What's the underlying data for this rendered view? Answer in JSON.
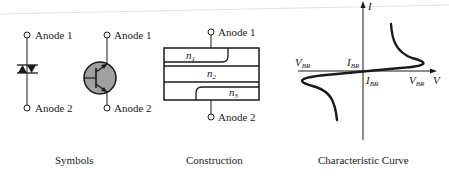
{
  "figure": {
    "panels": [
      {
        "id": "symbols",
        "caption": "Symbols",
        "terminal_top": "Anode 1",
        "terminal_bottom": "Anode 2"
      },
      {
        "id": "construction",
        "caption": "Construction",
        "terminal_top": "Anode 1",
        "terminal_bottom": "Anode 2",
        "layers": [
          "n",
          "n",
          "n"
        ],
        "layer_subscripts": [
          "1",
          "2",
          "3"
        ]
      },
      {
        "id": "characteristic-curve",
        "caption": "Characteristic Curve",
        "axis_x": "V",
        "axis_y": "I",
        "labels": {
          "vbr_left": "V",
          "vbr_left_sub": "BR",
          "ibr_top": "I",
          "ibr_top_sub": "BR",
          "ibr_bottom": "I",
          "ibr_bottom_sub": "BR",
          "vbr_right": "V",
          "vbr_right_sub": "BR"
        }
      }
    ]
  },
  "colors": {
    "ink": "#1a1a1a",
    "transistor_fill": "#a0a0a0"
  }
}
